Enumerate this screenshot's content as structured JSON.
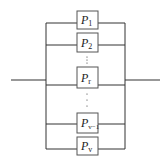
{
  "diagram": {
    "type": "parallel-system",
    "components": [
      {
        "base": "P",
        "sub": "1",
        "box": [
          77,
          11,
          21,
          18
        ],
        "line_y": 23
      },
      {
        "base": "P",
        "sub": "2",
        "box": [
          77,
          33,
          21,
          19
        ],
        "line_y": 45
      },
      {
        "base": "P",
        "sub": "r",
        "box": [
          77,
          67,
          21,
          21
        ],
        "line_y": 85
      },
      {
        "base": "P",
        "sub": "v−1",
        "box": [
          77,
          113,
          21,
          20
        ],
        "line_y": 124
      },
      {
        "base": "P",
        "sub": "v",
        "box": [
          77,
          137,
          21,
          18
        ],
        "line_y": 149
      }
    ],
    "ellipsis": [
      {
        "x": 87,
        "ys": [
          57,
          60,
          63
        ]
      },
      {
        "x": 87,
        "ys": [
          94,
          100,
          106
        ]
      }
    ],
    "rails": {
      "left_x": 46,
      "right_x": 125,
      "top_y": 23,
      "bottom_y": 149
    },
    "input": {
      "x1": 11,
      "x2": 46,
      "y": 80
    },
    "output": {
      "x1": 125,
      "x2": 160,
      "y": 80
    },
    "colors": {
      "line": "#333333",
      "box": "#555555",
      "background": "#ffffff"
    }
  }
}
